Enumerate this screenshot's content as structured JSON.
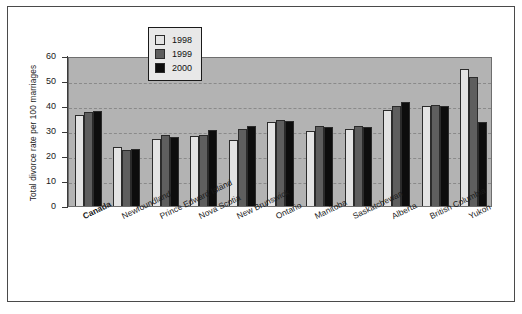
{
  "chart_data": {
    "type": "bar",
    "title": "",
    "xlabel": "",
    "ylabel": "Total divorce rate per 100 marriages",
    "ylim": [
      0,
      60
    ],
    "yticks": [
      0,
      10,
      20,
      30,
      40,
      50,
      60
    ],
    "grid": true,
    "legend_position": "top-center",
    "categories": [
      "Canada",
      "Newfoundland",
      "Prince Edward Island",
      "Nova Scotia",
      "New Brunswick",
      "Ontario",
      "Manitoba",
      "Saskatchewan",
      "Alberta",
      "British Columbia",
      "Yukon"
    ],
    "emphasized_categories": [
      "Canada"
    ],
    "series": [
      {
        "name": "1998",
        "color": "#e3e3e3",
        "values": [
          36.5,
          23.5,
          27.0,
          28.0,
          26.5,
          33.5,
          30.0,
          31.0,
          38.5,
          40.0,
          55.0
        ]
      },
      {
        "name": "1999",
        "color": "#5e5e5e",
        "values": [
          37.5,
          22.5,
          28.5,
          28.5,
          31.0,
          34.5,
          32.0,
          32.0,
          40.0,
          40.5,
          51.5
        ]
      },
      {
        "name": "2000",
        "color": "#0d0d0d",
        "values": [
          38.0,
          23.0,
          27.5,
          30.5,
          32.0,
          34.0,
          31.5,
          31.5,
          41.5,
          40.0,
          33.5
        ]
      }
    ]
  },
  "legend": {
    "items": [
      {
        "label": "1998",
        "key": "y1998"
      },
      {
        "label": "1999",
        "key": "y1999"
      },
      {
        "label": "2000",
        "key": "y2000"
      }
    ]
  },
  "colors": {
    "plot_background": "#b3b3b3",
    "figure_background": "#ffffff",
    "frame": "#4a4a4a",
    "gridline": "#8a8a8a"
  }
}
